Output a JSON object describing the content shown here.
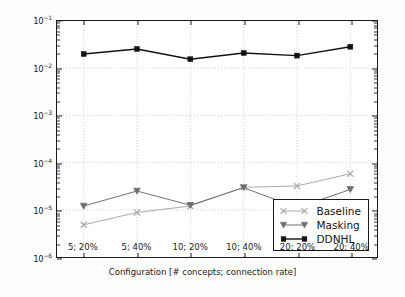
{
  "chart_data": {
    "type": "line",
    "title": "",
    "xlabel": "Configuration [# concepts; connection rate]",
    "ylabel": "Scaled MSE",
    "yscale": "log",
    "ylim": [
      1e-06,
      0.1
    ],
    "grid": true,
    "legend_position": "lower right",
    "categories": [
      "5; 20%",
      "5; 40%",
      "10; 20%",
      "10; 40%",
      "20; 20%",
      "20; 40%"
    ],
    "ytick_labels": [
      "10-1",
      "10-2",
      "10-3",
      "10-4",
      "10-5",
      "10-6"
    ],
    "ytick_values": [
      0.1,
      0.01,
      0.001,
      0.0001,
      1e-05,
      1e-06
    ],
    "series": [
      {
        "name": "Baseline",
        "marker": "x",
        "color": "#a8a8a8",
        "values": [
          4.8e-06,
          8.8e-06,
          1.2e-05,
          3e-05,
          3.2e-05,
          5.8e-05
        ]
      },
      {
        "name": "Masking",
        "marker": "triangle-down",
        "color": "#6e6e6e",
        "values": [
          1.2e-05,
          2.5e-05,
          1.25e-05,
          2.95e-05,
          1.1e-05,
          2.7e-05
        ]
      },
      {
        "name": "DDNHL",
        "marker": "circle",
        "color": "#111111",
        "values": [
          0.02,
          0.0255,
          0.0155,
          0.021,
          0.0185,
          0.0285
        ]
      }
    ]
  },
  "legend": {
    "items": [
      {
        "label": "Baseline"
      },
      {
        "label": "Masking"
      },
      {
        "label": "DDNHL"
      }
    ]
  }
}
